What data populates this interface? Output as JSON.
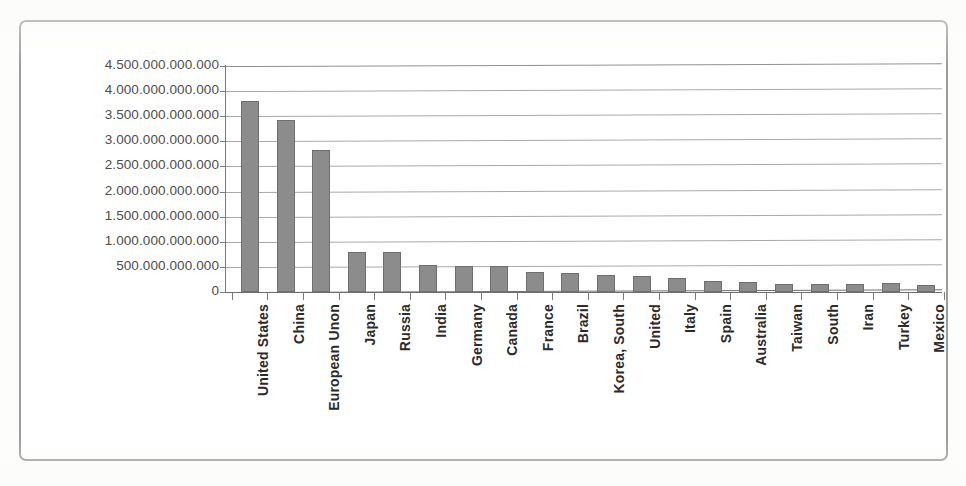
{
  "chart_data": {
    "type": "bar",
    "title": "",
    "subtitle": "",
    "xlabel": "",
    "ylabel": "",
    "grid": true,
    "legend": false,
    "ylim": [
      0,
      4500000000000
    ],
    "ytick_step": 500000000000,
    "ytick_labels": [
      "4.500.000.000.000",
      "4.000.000.000.000",
      "3.500.000.000.000",
      "3.000.000.000.000",
      "2.500.000.000.000",
      "2.000.000.000.000",
      "1.500.000.000.000",
      "1.000.000.000.000",
      "500.000.000.000",
      "0"
    ],
    "ytick_values": [
      4500000000000,
      4000000000000,
      3500000000000,
      3000000000000,
      2500000000000,
      2000000000000,
      1500000000000,
      1000000000000,
      500000000000,
      0
    ],
    "categories": [
      "United States",
      "China",
      "European Unon",
      "Japan",
      "Russia",
      "India",
      "Germany",
      "Canada",
      "France",
      "Brazil",
      "Korea, South",
      "United",
      "Italy",
      "Spain",
      "Australia",
      "Taiwan",
      "South",
      "Iran",
      "Turkey",
      "Mexico"
    ],
    "values": [
      3810000000000,
      3420000000000,
      2830000000000,
      790000000000,
      790000000000,
      540000000000,
      520000000000,
      510000000000,
      400000000000,
      380000000000,
      330000000000,
      310000000000,
      280000000000,
      220000000000,
      190000000000,
      160000000000,
      160000000000,
      160000000000,
      180000000000,
      140000000000
    ]
  },
  "style": {
    "bar_fill": "#8c8c8c",
    "bar_stroke": "#6f6f6f",
    "gridline_color": "#a9a9a9",
    "axis_color": "#7a7a7a",
    "frame_color": "#9b9b9b",
    "label_color": "#2b2b2b",
    "tick_label_color": "#4d4d4d",
    "background": "#ffffff"
  }
}
